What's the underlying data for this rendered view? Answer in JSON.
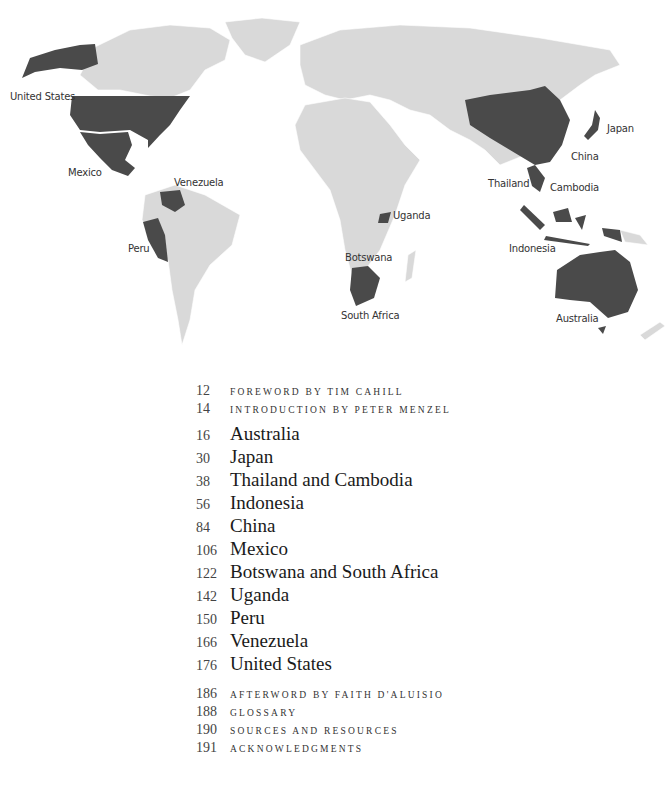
{
  "map": {
    "land_color": "#d9d9d9",
    "highlight_color": "#4a4a4a",
    "labels": [
      {
        "id": "united-states",
        "text": "United States",
        "x": 10,
        "y": 97
      },
      {
        "id": "mexico",
        "text": "Mexico",
        "x": 68,
        "y": 173
      },
      {
        "id": "venezuela",
        "text": "Venezuela",
        "x": 174,
        "y": 179
      },
      {
        "id": "peru",
        "text": "Peru",
        "x": 128,
        "y": 246
      },
      {
        "id": "uganda",
        "text": "Uganda",
        "x": 394,
        "y": 210
      },
      {
        "id": "botswana",
        "text": "Botswana",
        "x": 345,
        "y": 252
      },
      {
        "id": "south-africa",
        "text": "South Africa",
        "x": 341,
        "y": 309
      },
      {
        "id": "japan",
        "text": "Japan",
        "x": 607,
        "y": 123
      },
      {
        "id": "china",
        "text": "China",
        "x": 571,
        "y": 151
      },
      {
        "id": "thailand",
        "text": "Thailand",
        "x": 488,
        "y": 180
      },
      {
        "id": "cambodia",
        "text": "Cambodia",
        "x": 550,
        "y": 183
      },
      {
        "id": "indonesia",
        "text": "Indonesia",
        "x": 509,
        "y": 243
      },
      {
        "id": "australia",
        "text": "Australia",
        "x": 556,
        "y": 313
      }
    ]
  },
  "toc": {
    "front_matter": [
      {
        "page": "12",
        "title": "Foreword by Tim Cahill"
      },
      {
        "page": "14",
        "title": "Introduction by Peter Menzel"
      }
    ],
    "chapters": [
      {
        "page": "16",
        "title": "Australia"
      },
      {
        "page": "30",
        "title": "Japan"
      },
      {
        "page": "38",
        "title": "Thailand and Cambodia"
      },
      {
        "page": "56",
        "title": "Indonesia"
      },
      {
        "page": "84",
        "title": "China"
      },
      {
        "page": "106",
        "title": "Mexico"
      },
      {
        "page": "122",
        "title": "Botswana and South Africa"
      },
      {
        "page": "142",
        "title": "Uganda"
      },
      {
        "page": "150",
        "title": "Peru"
      },
      {
        "page": "166",
        "title": "Venezuela"
      },
      {
        "page": "176",
        "title": "United States"
      }
    ],
    "back_matter": [
      {
        "page": "186",
        "title": "Afterword by Faith D'Aluisio"
      },
      {
        "page": "188",
        "title": "Glossary"
      },
      {
        "page": "190",
        "title": "Sources and Resources"
      },
      {
        "page": "191",
        "title": "Acknowledgments"
      }
    ]
  }
}
